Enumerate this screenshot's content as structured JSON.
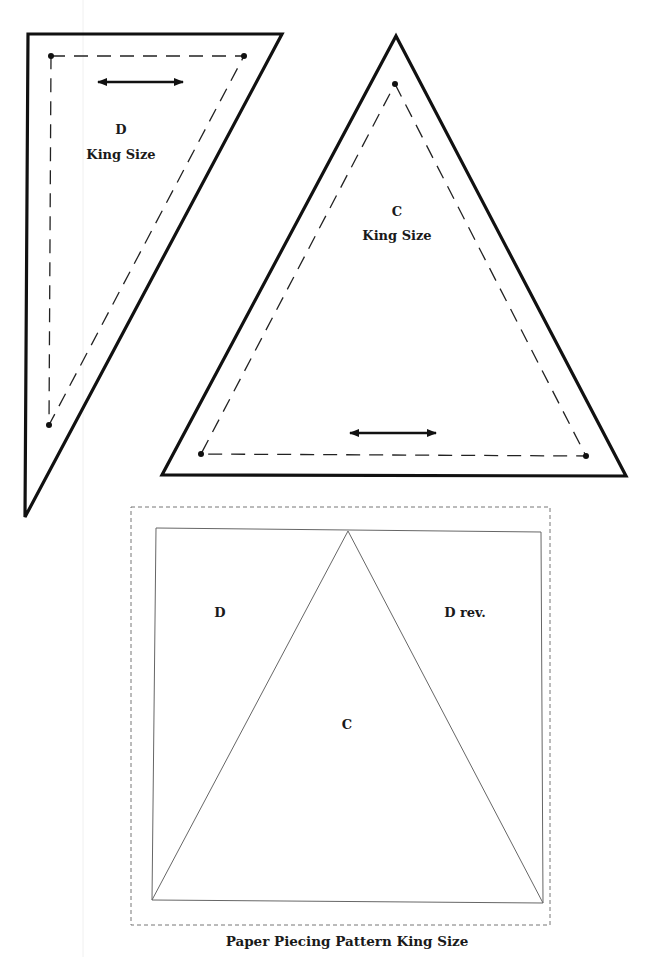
{
  "pieces": {
    "d": {
      "letter": "D",
      "size": "King Size",
      "outer": "28,34 282,34 25,517",
      "seam": "51,56 244,56 49,425",
      "arrow": {
        "x1": 98,
        "y1": 82,
        "x2": 183,
        "y2": 82
      },
      "dots": [
        [
          51,
          56
        ],
        [
          244,
          56
        ],
        [
          49,
          425
        ]
      ]
    },
    "c": {
      "letter": "C",
      "size": "King Size",
      "outer": "396,36 626,476 162,475",
      "seam": "395,84 586,456 201,454",
      "arrow": {
        "x1": 350,
        "y1": 433,
        "x2": 436,
        "y2": 433
      },
      "dots": [
        [
          395,
          84
        ],
        [
          201,
          454
        ],
        [
          586,
          456
        ]
      ]
    }
  },
  "pattern": {
    "outer_dashed": {
      "x": 131,
      "y": 507,
      "w": 419,
      "h": 418
    },
    "square": "156,528 541,532 543,903 152,900",
    "apex": [
      348,
      531
    ],
    "labels": {
      "left": "D",
      "right": "D rev.",
      "center": "C"
    },
    "caption": "Paper Piecing Pattern King Size"
  },
  "colors": {
    "line": "#111111",
    "thin_line": "#6e6e6e",
    "dashed": "#777777"
  }
}
